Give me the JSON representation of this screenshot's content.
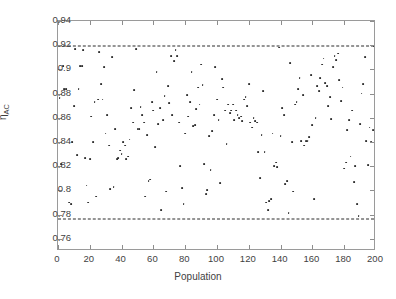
{
  "chart_data": {
    "type": "scatter",
    "title": "",
    "xlabel": "Population",
    "ylabel": "η",
    "ylabel_subscript": "AC",
    "xlim": [
      0,
      200
    ],
    "ylim": [
      0.75,
      0.94
    ],
    "xticks": [
      0,
      20,
      40,
      60,
      80,
      100,
      120,
      140,
      160,
      180,
      200
    ],
    "xticklabels": [
      "0",
      "20",
      "40",
      "60",
      "80",
      "100",
      "120",
      "140",
      "160",
      "180",
      "200"
    ],
    "yticks": [
      0.76,
      0.78,
      0.8,
      0.82,
      0.84,
      0.86,
      0.88,
      0.9,
      0.92,
      0.94
    ],
    "yticklabels": [
      "0.76",
      "0.78",
      "0.8",
      "0.82",
      "0.84",
      "0.86",
      "0.88",
      "0.9",
      "0.92",
      "0.94"
    ],
    "grid": false,
    "legend": null,
    "marker": "dot",
    "marker_color": "#2b2b2b",
    "background_color": "#ffffff",
    "axis_color": "#9a9a9a",
    "reference_lines": [
      {
        "name": "upper-bound",
        "orientation": "horizontal",
        "y": 0.9195,
        "style": "dashed",
        "color": "#2b2b2b"
      },
      {
        "name": "lower-bound",
        "orientation": "horizontal",
        "y": 0.7765,
        "style": "dashed",
        "color": "#2b2b2b"
      }
    ],
    "x": [
      1,
      2,
      3,
      4,
      5,
      6,
      7,
      8,
      9,
      10,
      11,
      12,
      13,
      14,
      15,
      16,
      17,
      18,
      19,
      20,
      21,
      22,
      23,
      24,
      25,
      26,
      27,
      28,
      29,
      30,
      31,
      32,
      33,
      34,
      35,
      36,
      37,
      38,
      39,
      40,
      41,
      42,
      43,
      44,
      45,
      46,
      47,
      48,
      49,
      50,
      51,
      52,
      53,
      54,
      55,
      56,
      57,
      58,
      59,
      60,
      61,
      62,
      63,
      64,
      65,
      66,
      67,
      68,
      69,
      70,
      71,
      72,
      73,
      74,
      75,
      76,
      77,
      78,
      79,
      80,
      81,
      82,
      83,
      84,
      85,
      86,
      87,
      88,
      89,
      90,
      91,
      92,
      93,
      94,
      95,
      96,
      97,
      98,
      99,
      100,
      101,
      102,
      103,
      104,
      105,
      106,
      107,
      108,
      109,
      110,
      111,
      112,
      113,
      114,
      115,
      116,
      117,
      118,
      119,
      120,
      121,
      122,
      123,
      124,
      125,
      126,
      127,
      128,
      129,
      130,
      131,
      132,
      133,
      134,
      135,
      136,
      137,
      138,
      139,
      140,
      141,
      142,
      143,
      144,
      145,
      146,
      147,
      148,
      149,
      150,
      151,
      152,
      153,
      154,
      155,
      156,
      157,
      158,
      159,
      160,
      161,
      162,
      163,
      164,
      165,
      166,
      167,
      168,
      169,
      170,
      171,
      172,
      173,
      174,
      175,
      176,
      177,
      178,
      179,
      180,
      181,
      182,
      183,
      184,
      185,
      186,
      187,
      188,
      189,
      190,
      191,
      192,
      193,
      194,
      195,
      196,
      197,
      198,
      199,
      200
    ],
    "y": [
      0.876,
      0.822,
      0.903,
      0.884,
      0.884,
      0.899,
      0.79,
      0.789,
      0.84,
      0.87,
      0.917,
      0.829,
      0.884,
      0.903,
      0.903,
      0.916,
      0.827,
      0.804,
      0.79,
      0.826,
      0.861,
      0.84,
      0.873,
      0.795,
      0.875,
      0.914,
      0.888,
      0.875,
      0.902,
      0.847,
      0.862,
      0.837,
      0.801,
      0.91,
      0.803,
      0.851,
      0.826,
      0.827,
      0.833,
      0.83,
      0.84,
      0.837,
      0.826,
      0.828,
      0.842,
      0.868,
      0.856,
      0.883,
      0.917,
      0.851,
      0.851,
      0.869,
      0.862,
      0.856,
      0.795,
      0.846,
      0.808,
      0.809,
      0.873,
      0.866,
      0.836,
      0.898,
      0.855,
      0.868,
      0.784,
      0.858,
      0.878,
      0.799,
      0.886,
      0.872,
      0.911,
      0.862,
      0.907,
      0.916,
      0.911,
      0.856,
      0.82,
      0.802,
      0.789,
      0.847,
      0.879,
      0.861,
      0.873,
      0.898,
      0.853,
      0.854,
      0.867,
      0.885,
      0.871,
      0.904,
      0.887,
      0.822,
      0.797,
      0.8,
      0.845,
      0.817,
      0.849,
      0.862,
      0.902,
      0.875,
      0.858,
      0.806,
      0.892,
      0.885,
      0.866,
      0.838,
      0.871,
      0.864,
      0.866,
      0.871,
      0.858,
      0.866,
      0.862,
      0.86,
      0.861,
      0.857,
      0.875,
      0.877,
      0.87,
      0.888,
      0.856,
      0.852,
      0.86,
      0.857,
      0.856,
      0.832,
      0.81,
      0.846,
      0.882,
      0.832,
      0.79,
      0.784,
      0.791,
      0.793,
      0.847,
      0.82,
      0.823,
      0.819,
      0.918,
      0.845,
      0.868,
      0.862,
      0.805,
      0.808,
      0.781,
      0.905,
      0.84,
      0.799,
      0.871,
      0.873,
      0.884,
      0.893,
      0.841,
      0.879,
      0.837,
      0.841,
      0.841,
      0.844,
      0.895,
      0.854,
      0.793,
      0.86,
      0.886,
      0.882,
      0.893,
      0.904,
      0.909,
      0.889,
      0.886,
      0.87,
      0.877,
      0.859,
      0.902,
      0.911,
      0.908,
      0.913,
      0.891,
      0.874,
      0.885,
      0.818,
      0.823,
      0.85,
      0.858,
      0.828,
      0.866,
      0.807,
      0.82,
      0.789,
      0.779,
      0.855,
      0.88,
      0.888,
      0.91,
      0.841,
      0.821,
      0.852,
      0.84,
      0.85,
      0.919,
      0.861
    ]
  },
  "figure": {
    "name": "scatter-plot-population-eta-ac"
  }
}
